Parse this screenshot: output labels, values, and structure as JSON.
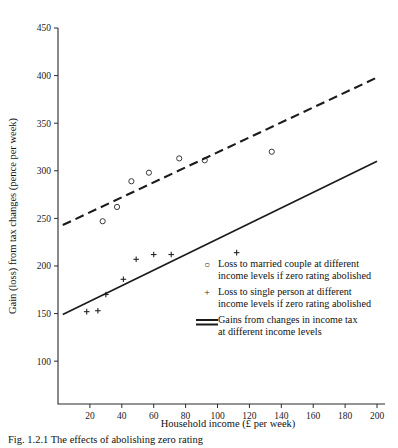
{
  "chart_data": {
    "type": "scatter",
    "title": "",
    "xlabel": "Household income (£ per week)",
    "ylabel": "Gain (loss) from tax changes (pence per week)",
    "xlim": [
      0,
      205
    ],
    "ylim": [
      55,
      450
    ],
    "xticks": [
      20,
      40,
      60,
      80,
      100,
      120,
      140,
      160,
      180,
      200
    ],
    "yticks": [
      100,
      150,
      200,
      250,
      300,
      350,
      400,
      450
    ],
    "grid": false,
    "legend_position": "inside-lower-right",
    "series": [
      {
        "name": "Loss to married couple at different income levels if zero rating abolished",
        "marker": "circle",
        "points": [
          {
            "x": 28,
            "y": 247
          },
          {
            "x": 37,
            "y": 262
          },
          {
            "x": 46,
            "y": 289
          },
          {
            "x": 57,
            "y": 298
          },
          {
            "x": 76,
            "y": 313
          },
          {
            "x": 92,
            "y": 311
          },
          {
            "x": 134,
            "y": 320
          }
        ]
      },
      {
        "name": "Loss to single person at different income levels if zero rating abolished",
        "marker": "plus",
        "points": [
          {
            "x": 18,
            "y": 152
          },
          {
            "x": 25,
            "y": 153
          },
          {
            "x": 30,
            "y": 170
          },
          {
            "x": 41,
            "y": 186
          },
          {
            "x": 49,
            "y": 207
          },
          {
            "x": 60,
            "y": 212
          },
          {
            "x": 71,
            "y": 212
          },
          {
            "x": 112,
            "y": 214
          }
        ]
      },
      {
        "name": "Gains from changes in income tax at different income levels (married)",
        "marker": "dashed-line",
        "line": [
          {
            "x": 3,
            "y": 243
          },
          {
            "x": 200,
            "y": 398
          }
        ]
      },
      {
        "name": "Gains from changes in income tax at different income levels (single)",
        "marker": "solid-line",
        "line": [
          {
            "x": 3,
            "y": 149
          },
          {
            "x": 200,
            "y": 310
          }
        ]
      }
    ]
  },
  "legend": {
    "entries": [
      {
        "key": "○",
        "key_type": "circle-marker",
        "line1": "Loss to married couple at different",
        "line2": "income levels if zero rating abolished"
      },
      {
        "key": "+",
        "key_type": "plus-marker",
        "line1": "Loss to single person at different",
        "line2": "income levels if zero rating abolished"
      },
      {
        "key": "",
        "key_type": "line-swatch",
        "line1": "Gains from changes in income tax",
        "line2": "at different income levels"
      }
    ]
  },
  "caption": {
    "text": "Fig. 1.2.1  The effects of abolishing zero rating"
  },
  "colors": {
    "ink": "#1a1a1a",
    "axis": "#2b2b2b",
    "marker": "#3a3a3a",
    "background": "#ffffff"
  }
}
